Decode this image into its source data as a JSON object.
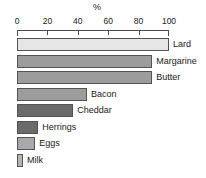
{
  "chart_data": {
    "type": "bar",
    "orientation": "horizontal",
    "title": "%",
    "xlabel": "%",
    "ylabel": "",
    "xlim": [
      0,
      100
    ],
    "grid": false,
    "legend": "none",
    "tick_labels": [
      "0",
      "20",
      "40",
      "60",
      "80",
      "100"
    ],
    "ticks": [
      0,
      20,
      40,
      60,
      80,
      100
    ],
    "categories": [
      "Lard",
      "Margarine",
      "Butter",
      "Bacon",
      "Cheddar",
      "Herrings",
      "Eggs",
      "Milk"
    ],
    "values": [
      100,
      89,
      89,
      46,
      37,
      14,
      12,
      4
    ],
    "bars": [
      {
        "label": "Lard",
        "value": 100,
        "color": "#e6e6e6"
      },
      {
        "label": "Margarine",
        "value": 89,
        "color": "#9c9c9c"
      },
      {
        "label": "Butter",
        "value": 89,
        "color": "#9c9c9c"
      },
      {
        "label": "Bacon",
        "value": 46,
        "color": "#9c9c9c"
      },
      {
        "label": "Cheddar",
        "value": 37,
        "color": "#6b6b6b"
      },
      {
        "label": "Herrings",
        "value": 14,
        "color": "#6b6b6b"
      },
      {
        "label": "Eggs",
        "value": 12,
        "color": "#a8a8a8"
      },
      {
        "label": "Milk",
        "value": 4,
        "color": "#b5b5b5"
      }
    ],
    "colors": {
      "axis": "#4a4a4a",
      "bar_outline": "#545454",
      "text": "#1a1a1a",
      "background": "#ffffff"
    }
  }
}
